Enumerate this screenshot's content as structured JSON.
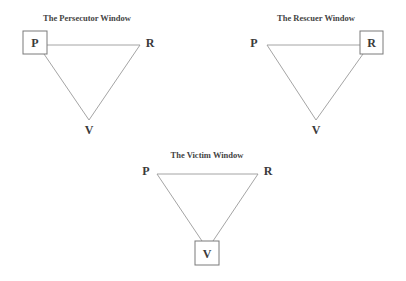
{
  "diagram": {
    "type": "drama-triangle-windows",
    "panels": [
      {
        "title": "The Persecutor Window",
        "highlighted": "P",
        "nodes": {
          "p": "P",
          "r": "R",
          "v": "V"
        }
      },
      {
        "title": "The Rescuer Window",
        "highlighted": "R",
        "nodes": {
          "p": "P",
          "r": "R",
          "v": "V"
        }
      },
      {
        "title": "The Victim Window",
        "highlighted": "V",
        "nodes": {
          "p": "P",
          "r": "R",
          "v": "V"
        }
      }
    ],
    "colors": {
      "background": "#ffffff",
      "edge": "#9a9a9a",
      "box": "#7a7a7a",
      "text": "#3a3a3a"
    }
  }
}
